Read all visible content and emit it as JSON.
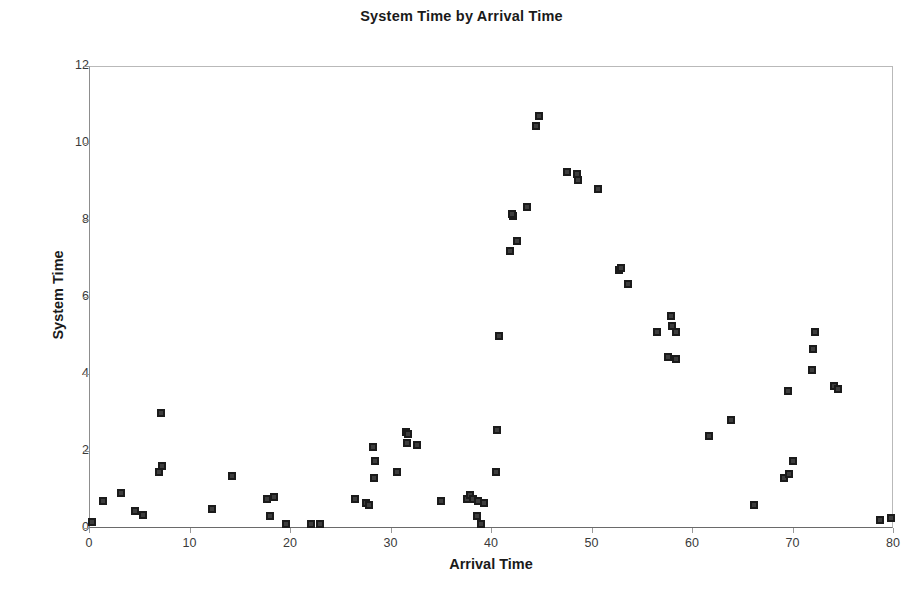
{
  "chart_data": {
    "type": "scatter",
    "title": "System Time by Arrival Time",
    "xlabel": "Arrival Time",
    "ylabel": "System Time",
    "xlim": [
      0,
      80
    ],
    "ylim": [
      0,
      12
    ],
    "xticks": [
      0,
      10,
      20,
      30,
      40,
      50,
      60,
      70,
      80
    ],
    "yticks": [
      0,
      2,
      4,
      6,
      8,
      10,
      12
    ],
    "grid": false,
    "legend": null,
    "marker": "square",
    "marker_color": "#1b1b1b",
    "series": [
      {
        "name": "System Time",
        "points": [
          [
            0.3,
            0.15
          ],
          [
            1.4,
            0.7
          ],
          [
            3.2,
            0.9
          ],
          [
            4.6,
            0.45
          ],
          [
            5.4,
            0.35
          ],
          [
            7.0,
            1.45
          ],
          [
            7.3,
            1.6
          ],
          [
            7.2,
            3.0
          ],
          [
            12.2,
            0.5
          ],
          [
            14.2,
            1.35
          ],
          [
            17.7,
            0.75
          ],
          [
            18.4,
            0.8
          ],
          [
            18.0,
            0.3
          ],
          [
            19.6,
            0.1
          ],
          [
            22.1,
            0.1
          ],
          [
            23.0,
            0.1
          ],
          [
            26.5,
            0.75
          ],
          [
            27.6,
            0.65
          ],
          [
            27.9,
            0.6
          ],
          [
            28.3,
            2.1
          ],
          [
            28.4,
            1.3
          ],
          [
            28.5,
            1.75
          ],
          [
            30.6,
            1.45
          ],
          [
            31.5,
            2.5
          ],
          [
            31.7,
            2.45
          ],
          [
            31.6,
            2.2
          ],
          [
            32.6,
            2.15
          ],
          [
            35.0,
            0.7
          ],
          [
            37.6,
            0.75
          ],
          [
            37.9,
            0.85
          ],
          [
            38.2,
            0.75
          ],
          [
            38.7,
            0.7
          ],
          [
            39.3,
            0.65
          ],
          [
            38.6,
            0.3
          ],
          [
            39.0,
            0.1
          ],
          [
            40.5,
            1.45
          ],
          [
            40.6,
            2.55
          ],
          [
            40.8,
            5.0
          ],
          [
            41.9,
            7.2
          ],
          [
            42.2,
            8.1
          ],
          [
            42.1,
            8.15
          ],
          [
            42.6,
            7.45
          ],
          [
            43.6,
            8.35
          ],
          [
            44.5,
            10.45
          ],
          [
            44.8,
            10.7
          ],
          [
            47.6,
            9.25
          ],
          [
            48.6,
            9.2
          ],
          [
            48.7,
            9.05
          ],
          [
            50.6,
            8.8
          ],
          [
            52.7,
            6.7
          ],
          [
            52.9,
            6.75
          ],
          [
            53.6,
            6.35
          ],
          [
            56.5,
            5.1
          ],
          [
            57.9,
            5.5
          ],
          [
            58.0,
            5.25
          ],
          [
            58.4,
            5.1
          ],
          [
            57.6,
            4.45
          ],
          [
            58.4,
            4.4
          ],
          [
            61.7,
            2.4
          ],
          [
            63.9,
            2.8
          ],
          [
            66.2,
            0.6
          ],
          [
            69.2,
            1.3
          ],
          [
            69.7,
            1.4
          ],
          [
            70.0,
            1.75
          ],
          [
            69.6,
            3.55
          ],
          [
            71.9,
            4.1
          ],
          [
            72.2,
            5.1
          ],
          [
            72.0,
            4.65
          ],
          [
            74.1,
            3.7
          ],
          [
            74.5,
            3.6
          ],
          [
            78.7,
            0.2
          ],
          [
            79.8,
            0.25
          ]
        ]
      }
    ]
  }
}
